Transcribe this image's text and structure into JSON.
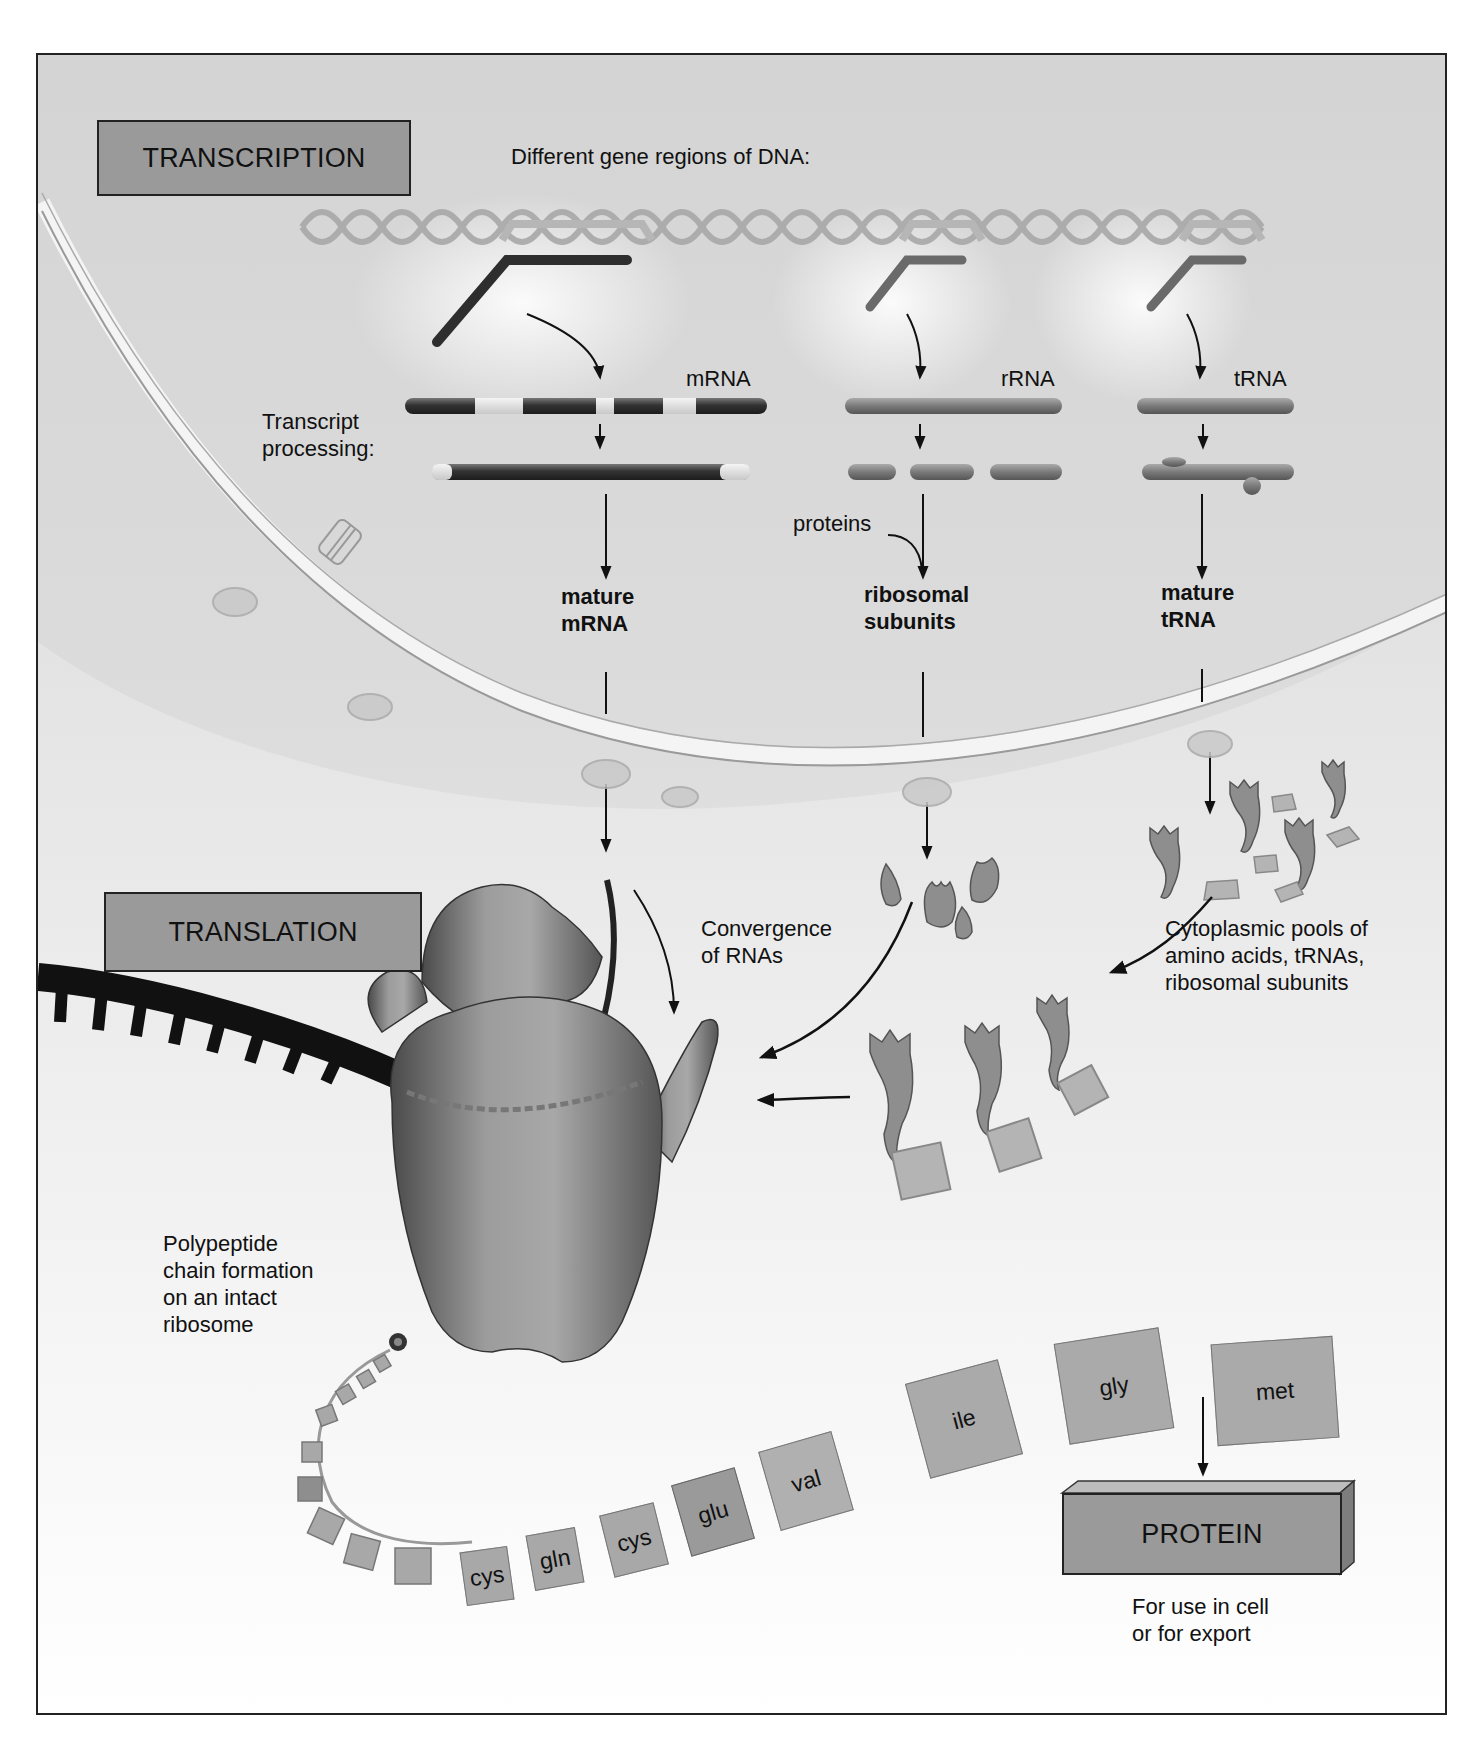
{
  "transcription": {
    "title": "TRANSCRIPTION",
    "dna_caption": "Different gene regions of DNA:",
    "processing_label_line1": "Transcript",
    "processing_label_line2": "processing:",
    "columns": [
      {
        "primary": "mRNA",
        "mature_line1": "mature",
        "mature_line2": "mRNA"
      },
      {
        "primary": "rRNA",
        "mature_line1": "ribosomal",
        "mature_line2": "subunits",
        "added": "proteins"
      },
      {
        "primary": "tRNA",
        "mature_line1": "mature",
        "mature_line2": "tRNA"
      }
    ]
  },
  "translation": {
    "title": "TRANSLATION",
    "convergence_line1": "Convergence",
    "convergence_line2": "of RNAs",
    "pools_line1": "Cytoplasmic pools of",
    "pools_line2": "amino acids, tRNAs,",
    "pools_line3": "ribosomal subunits",
    "polypeptide_line1": "Polypeptide",
    "polypeptide_line2": "chain formation",
    "polypeptide_line3": "on an intact",
    "polypeptide_line4": "ribosome",
    "amino_acid_chain": [
      "cys",
      "gln",
      "cys",
      "glu",
      "val",
      "ile",
      "gly",
      "met"
    ]
  },
  "protein": {
    "title": "PROTEIN",
    "note_line1": "For use in cell",
    "note_line2": "or for export"
  },
  "colors": {
    "section_box": "#9a9a9a",
    "nucleus_bg": "#d4d4d4",
    "cytoplasm_bg": "#f5f5f5",
    "dark_rna": "#3a3a3a",
    "border": "#222222"
  }
}
